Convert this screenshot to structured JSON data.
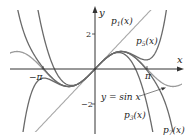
{
  "figure": {
    "axes": {
      "x_label": "x",
      "y_label": "y",
      "x_ticks": [
        {
          "label": "−π",
          "value": -3.14159
        },
        {
          "label": "π",
          "value": 3.14159
        }
      ],
      "y_ticks": [
        {
          "label": "2",
          "value": 2
        },
        {
          "label": "−2",
          "value": -2
        }
      ]
    },
    "curves": [
      {
        "name": "sin",
        "label": "y = sin x",
        "color": "#9a9a9a"
      },
      {
        "name": "p1",
        "label": "p",
        "sub": "1",
        "arg": "(x)",
        "color": "#a8a8a8"
      },
      {
        "name": "p3",
        "label": "p",
        "sub": "3",
        "arg": "(x)",
        "color": "#6a6a6a"
      },
      {
        "name": "p5",
        "label": "p",
        "sub": "5",
        "arg": "(x)",
        "color": "#6a6a6a"
      },
      {
        "name": "p7",
        "label": "p",
        "sub": "7",
        "arg": "(x)",
        "color": "#6a6a6a"
      }
    ],
    "colors": {
      "axis": "#333333",
      "light_curve": "#a8a8a8",
      "dark_curve": "#6a6a6a"
    }
  }
}
